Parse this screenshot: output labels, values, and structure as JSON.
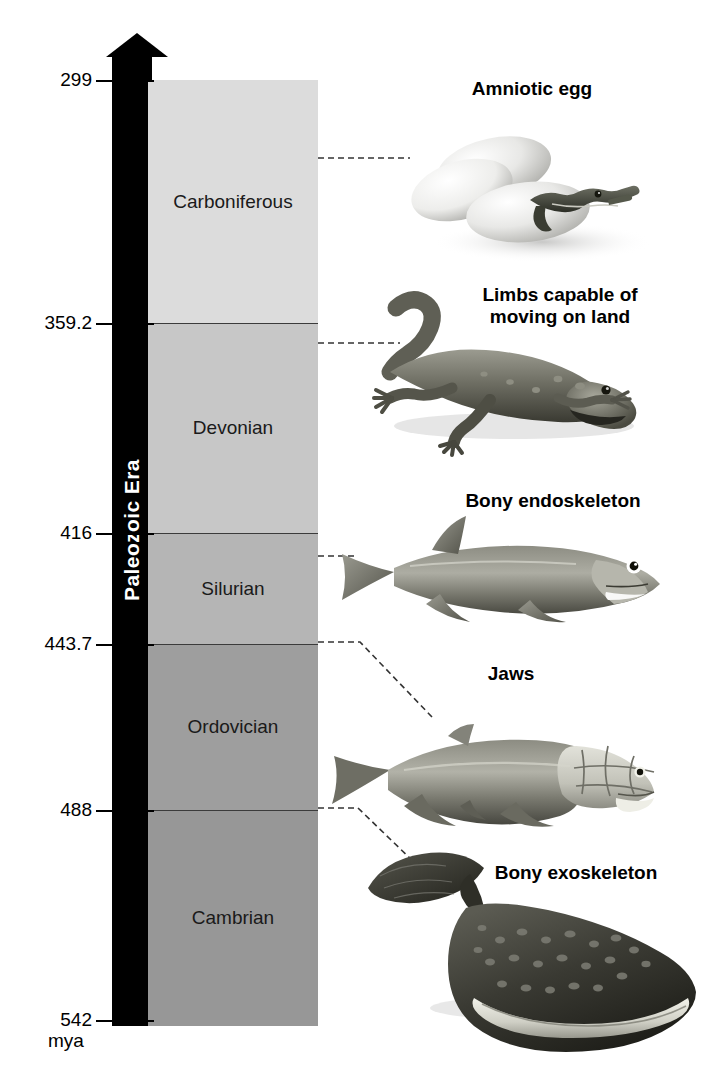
{
  "figure": {
    "era_label": "Paleozoic Era",
    "time_unit": "mya",
    "background_color": "#ffffff",
    "arrow_color": "#000000"
  },
  "axis": {
    "unit_label": "mya",
    "direction": "older at bottom, younger at top",
    "ticks": [
      {
        "value": "299",
        "y": 80
      },
      {
        "value": "359.2",
        "y": 323
      },
      {
        "value": "416",
        "y": 533
      },
      {
        "value": "443.7",
        "y": 644
      },
      {
        "value": "488",
        "y": 810
      },
      {
        "value": "542",
        "y": 1020
      }
    ]
  },
  "periods": [
    {
      "name": "Carboniferous",
      "start_mya": 359.2,
      "end_mya": 299,
      "color": "#dcdcdc",
      "top": 80,
      "height": 243
    },
    {
      "name": "Devonian",
      "start_mya": 416,
      "end_mya": 359.2,
      "color": "#c7c7c7",
      "top": 323,
      "height": 210
    },
    {
      "name": "Silurian",
      "start_mya": 443.7,
      "end_mya": 416,
      "color": "#b5b5b5",
      "top": 533,
      "height": 111
    },
    {
      "name": "Ordovician",
      "start_mya": 488,
      "end_mya": 443.7,
      "color": "#9e9e9e",
      "top": 644,
      "height": 166
    },
    {
      "name": "Cambrian",
      "start_mya": 542,
      "end_mya": 488,
      "color": "#979797",
      "top": 810,
      "height": 216
    }
  ],
  "callouts": [
    {
      "label": "Amniotic egg",
      "organism": "amniote-eggs-with-hatchling",
      "period": "Carboniferous",
      "label_left": 432,
      "label_top": 78,
      "label_width": 200
    },
    {
      "label": "Limbs capable of\nmoving on land",
      "organism": "early-tetrapod",
      "period": "Devonian",
      "label_left": 452,
      "label_top": 284,
      "label_width": 216
    },
    {
      "label": "Bony endoskeleton",
      "organism": "bony-fish",
      "period": "Silurian",
      "label_left": 438,
      "label_top": 490,
      "label_width": 230
    },
    {
      "label": "Jaws",
      "organism": "placoderm-fish",
      "period": "Ordovician",
      "label_left": 456,
      "label_top": 663,
      "label_width": 110
    },
    {
      "label": "Bony exoskeleton",
      "organism": "ostracoderm-jawless-fish",
      "period": "Cambrian",
      "label_left": 466,
      "label_top": 862,
      "label_width": 220
    }
  ]
}
